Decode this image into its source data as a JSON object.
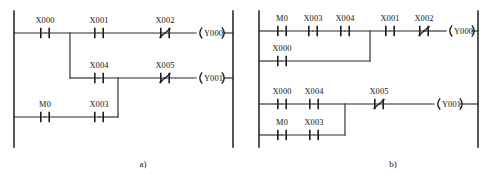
{
  "figure": {
    "line_color": "#2b2b2b",
    "background": "#ffffff"
  },
  "diagrams": [
    {
      "id": "diagram-a",
      "caption": "a)",
      "caption_x": 143,
      "caption_y": 167,
      "left_rail": {
        "x": 14,
        "y1": 11,
        "y2": 147
      },
      "right_rail": {
        "x": 233,
        "y1": 11,
        "y2": 147
      },
      "rungs": [
        {
          "id": "rung-a-1",
          "y": 33,
          "contacts": [
            {
              "name": "X000",
              "type": "no",
              "x": 45,
              "label_dy": -10
            },
            {
              "name": "X001",
              "type": "no",
              "x": 99,
              "label_dy": -10
            },
            {
              "name": "X002",
              "type": "nc",
              "x": 165,
              "label_dy": -10
            }
          ],
          "coil": {
            "name": "Y000",
            "x": 199
          }
        },
        {
          "id": "rung-a-2",
          "y": 78,
          "contacts": [
            {
              "name": "X004",
              "type": "no",
              "x": 99,
              "label_dy": -10
            },
            {
              "name": "X005",
              "type": "nc",
              "x": 165,
              "label_dy": -10
            }
          ],
          "coil": {
            "name": "Y001",
            "x": 199
          }
        },
        {
          "id": "rung-a-3",
          "y": 117,
          "contacts": [
            {
              "name": "M0",
              "type": "no",
              "x": 45,
              "label_dy": -10
            },
            {
              "name": "X003",
              "type": "no",
              "x": 99,
              "label_dy": -10
            }
          ],
          "coil": null
        }
      ],
      "branch_verticals": [
        {
          "id": "branch-a-x000-down",
          "x": 70,
          "y1": 33,
          "y2": 78
        },
        {
          "id": "branch-a-x004-down",
          "x": 118,
          "y1": 78,
          "y2": 117
        }
      ],
      "segments": [
        {
          "id": "seg-a1-left",
          "x1": 14,
          "y1": 33,
          "x2": 45,
          "y2": 33
        },
        {
          "id": "seg-a1-mid",
          "x1": 45,
          "y1": 33,
          "x2": 99,
          "y2": 33
        },
        {
          "id": "seg-a1-right",
          "x1": 99,
          "y1": 33,
          "x2": 165,
          "y2": 33
        },
        {
          "id": "seg-a1-coil",
          "x1": 165,
          "y1": 33,
          "x2": 196,
          "y2": 33
        },
        {
          "id": "seg-a1-coil-end",
          "x1": 224,
          "y1": 33,
          "x2": 233,
          "y2": 33
        },
        {
          "id": "seg-a2-left",
          "x1": 70,
          "y1": 78,
          "x2": 99,
          "y2": 78
        },
        {
          "id": "seg-a2-right",
          "x1": 99,
          "y1": 78,
          "x2": 165,
          "y2": 78
        },
        {
          "id": "seg-a2-coil",
          "x1": 165,
          "y1": 78,
          "x2": 196,
          "y2": 78
        },
        {
          "id": "seg-a2-coil-end",
          "x1": 224,
          "y1": 78,
          "x2": 233,
          "y2": 78
        },
        {
          "id": "seg-a3-left",
          "x1": 14,
          "y1": 117,
          "x2": 45,
          "y2": 117
        },
        {
          "id": "seg-a3-mid",
          "x1": 45,
          "y1": 117,
          "x2": 99,
          "y2": 117
        },
        {
          "id": "seg-a3-right",
          "x1": 99,
          "y1": 117,
          "x2": 118,
          "y2": 117
        }
      ]
    },
    {
      "id": "diagram-b",
      "caption": "b)",
      "caption_x": 393,
      "caption_y": 167,
      "left_rail": {
        "x": 259,
        "y1": 11,
        "y2": 147
      },
      "right_rail": {
        "x": 478,
        "y1": 11,
        "y2": 147
      },
      "rungs": [
        {
          "id": "rung-b-1",
          "y": 31,
          "contacts": [
            {
              "name": "M0",
              "type": "no",
              "x": 282,
              "label_dy": -10
            },
            {
              "name": "X003",
              "type": "no",
              "x": 313,
              "label_dy": -10
            },
            {
              "name": "X004",
              "type": "no",
              "x": 345,
              "label_dy": -10
            },
            {
              "name": "X001",
              "type": "no",
              "x": 390,
              "label_dy": -10
            },
            {
              "name": "X002",
              "type": "nc",
              "x": 424,
              "label_dy": -10
            }
          ],
          "coil": {
            "name": "Y000",
            "x": 449
          }
        },
        {
          "id": "rung-b-2",
          "y": 61,
          "contacts": [
            {
              "name": "X000",
              "type": "no",
              "x": 282,
              "label_dy": -10
            }
          ],
          "coil": null
        },
        {
          "id": "rung-b-3",
          "y": 104,
          "contacts": [
            {
              "name": "X000",
              "type": "no",
              "x": 282,
              "label_dy": -10
            },
            {
              "name": "X004",
              "type": "no",
              "x": 314,
              "label_dy": -10
            },
            {
              "name": "X005",
              "type": "nc",
              "x": 379,
              "label_dy": -10
            }
          ],
          "coil": {
            "name": "Y001",
            "x": 437
          }
        },
        {
          "id": "rung-b-4",
          "y": 135,
          "contacts": [
            {
              "name": "M0",
              "type": "no",
              "x": 282,
              "label_dy": -10
            },
            {
              "name": "X003",
              "type": "no",
              "x": 314,
              "label_dy": -10
            }
          ],
          "coil": null
        }
      ],
      "branch_verticals": [
        {
          "id": "branch-b-r1-join",
          "x": 370,
          "y1": 31,
          "y2": 61
        },
        {
          "id": "branch-b-r3-join",
          "x": 345,
          "y1": 104,
          "y2": 135
        }
      ],
      "segments": [
        {
          "id": "seg-b1-a",
          "x1": 259,
          "y1": 31,
          "x2": 282,
          "y2": 31
        },
        {
          "id": "seg-b1-b",
          "x1": 282,
          "y1": 31,
          "x2": 313,
          "y2": 31
        },
        {
          "id": "seg-b1-c",
          "x1": 313,
          "y1": 31,
          "x2": 345,
          "y2": 31
        },
        {
          "id": "seg-b1-d",
          "x1": 345,
          "y1": 31,
          "x2": 390,
          "y2": 31
        },
        {
          "id": "seg-b1-e",
          "x1": 390,
          "y1": 31,
          "x2": 424,
          "y2": 31
        },
        {
          "id": "seg-b1-coil",
          "x1": 424,
          "y1": 31,
          "x2": 446,
          "y2": 31
        },
        {
          "id": "seg-b1-coil-end",
          "x1": 472,
          "y1": 31,
          "x2": 478,
          "y2": 31
        },
        {
          "id": "seg-b2-a",
          "x1": 259,
          "y1": 61,
          "x2": 282,
          "y2": 61
        },
        {
          "id": "seg-b2-b",
          "x1": 282,
          "y1": 61,
          "x2": 370,
          "y2": 61
        },
        {
          "id": "seg-b3-a",
          "x1": 259,
          "y1": 104,
          "x2": 282,
          "y2": 104
        },
        {
          "id": "seg-b3-b",
          "x1": 282,
          "y1": 104,
          "x2": 314,
          "y2": 104
        },
        {
          "id": "seg-b3-c",
          "x1": 314,
          "y1": 104,
          "x2": 379,
          "y2": 104
        },
        {
          "id": "seg-b3-coil",
          "x1": 379,
          "y1": 104,
          "x2": 434,
          "y2": 104
        },
        {
          "id": "seg-b3-coil-end",
          "x1": 460,
          "y1": 104,
          "x2": 478,
          "y2": 104
        },
        {
          "id": "seg-b4-a",
          "x1": 259,
          "y1": 135,
          "x2": 282,
          "y2": 135
        },
        {
          "id": "seg-b4-b",
          "x1": 282,
          "y1": 135,
          "x2": 314,
          "y2": 135
        },
        {
          "id": "seg-b4-c",
          "x1": 314,
          "y1": 135,
          "x2": 345,
          "y2": 135
        }
      ]
    }
  ]
}
